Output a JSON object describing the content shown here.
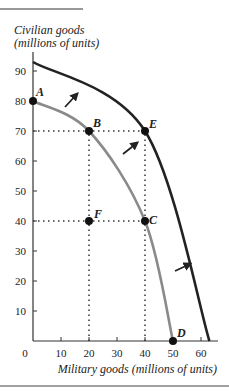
{
  "chart_data": {
    "type": "line",
    "title": "",
    "ylabel": "Civilian goods (millions of units)",
    "ylabel_lines": [
      "Civilian goods",
      "(millions of units)"
    ],
    "xlabel": "Military goods (millions of units)",
    "xlim": [
      0,
      65
    ],
    "ylim": [
      0,
      95
    ],
    "x_ticks": [
      0,
      10,
      20,
      30,
      40,
      50,
      60
    ],
    "y_ticks": [
      10,
      20,
      30,
      40,
      50,
      60,
      70,
      80,
      90
    ],
    "grid": false,
    "legend": null,
    "series": [
      {
        "name": "Original PPF",
        "color": "#8a8a8a",
        "points": [
          [
            0,
            80
          ],
          [
            20,
            70
          ],
          [
            40,
            40
          ],
          [
            50,
            0
          ]
        ]
      },
      {
        "name": "Shifted PPF",
        "color": "#222222",
        "points": [
          [
            0,
            93
          ],
          [
            40,
            70
          ],
          [
            63,
            0
          ]
        ]
      }
    ],
    "labeled_points": [
      {
        "label": "A",
        "x": 0,
        "y": 80
      },
      {
        "label": "B",
        "x": 20,
        "y": 70
      },
      {
        "label": "C",
        "x": 40,
        "y": 40
      },
      {
        "label": "D",
        "x": 50,
        "y": 0
      },
      {
        "label": "E",
        "x": 40,
        "y": 70
      },
      {
        "label": "F",
        "x": 20,
        "y": 40
      }
    ],
    "dotted_guides": [
      {
        "from": [
          0,
          70
        ],
        "to": [
          40,
          70
        ]
      },
      {
        "from": [
          0,
          40
        ],
        "to": [
          40,
          40
        ]
      },
      {
        "from": [
          20,
          0
        ],
        "to": [
          20,
          70
        ]
      },
      {
        "from": [
          40,
          0
        ],
        "to": [
          40,
          70
        ]
      }
    ],
    "annotations": [
      "Three arrows indicate outward shift of the production possibilities frontier"
    ]
  }
}
